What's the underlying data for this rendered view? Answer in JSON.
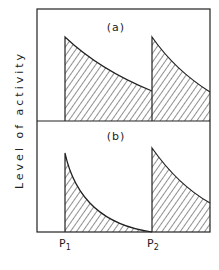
{
  "figure": {
    "y_axis_label": "Level of activity",
    "panels": [
      {
        "label": "(a)",
        "description": "Activity decays slowly after each stimulus; residual activity remains when P2 arrives"
      },
      {
        "label": "(b)",
        "description": "Activity decays quickly to zero before P2 arrives"
      }
    ],
    "x_ticks": [
      {
        "label": "P",
        "sub": "1"
      },
      {
        "label": "P",
        "sub": "2"
      }
    ],
    "colors": {
      "ink": "#222222",
      "background": "#ffffff"
    }
  }
}
